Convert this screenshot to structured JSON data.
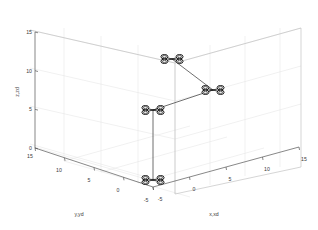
{
  "figure": {
    "kind": "matlab-3d-trajectory-plot",
    "background_color": "#ffffff",
    "axis_color": "#555555",
    "grid_color": "#e2e2e2",
    "trajectory_color": "#4a4a4a",
    "marker_color": "#1a1a1a"
  },
  "chart_data": {
    "type": "scatter",
    "title": "",
    "projection": "3d",
    "xlabel": "x,xd",
    "ylabel": "y,yd",
    "zlabel": "z,zd",
    "xlim": [
      -5,
      15
    ],
    "ylim": [
      -5,
      15
    ],
    "zlim": [
      0,
      15
    ],
    "xticks": [
      -5,
      0,
      5,
      10,
      15
    ],
    "yticks": [
      -5,
      0,
      5,
      10,
      15
    ],
    "zticks": [
      0,
      5,
      10,
      15
    ],
    "xticklabels": [
      "-5",
      "0",
      "5",
      "10",
      "15"
    ],
    "yticklabels": [
      "-5",
      "0",
      "5",
      "10",
      "15"
    ],
    "zticklabels": [
      "0",
      "5",
      "10",
      "15"
    ],
    "grid": true,
    "legend": false,
    "marker_style": "quadcopter-icon",
    "series": [
      {
        "name": "waypoint-trajectory",
        "points": [
          {
            "label": "wp1",
            "x": 0,
            "y": 0,
            "z": 0
          },
          {
            "label": "wp2",
            "x": 0,
            "y": 0,
            "z": 8
          },
          {
            "label": "wp3",
            "x": 5,
            "y": 0,
            "z": 10
          },
          {
            "label": "wp4",
            "x": 5,
            "y": 0,
            "z": 13
          }
        ]
      }
    ],
    "pixel_markers": [
      {
        "name": "drone-marker-1",
        "cx": 172.0,
        "cy": 59.0
      },
      {
        "name": "drone-marker-2",
        "cx": 213.0,
        "cy": 90.0
      },
      {
        "name": "drone-marker-3",
        "cx": 153.0,
        "cy": 110.0
      },
      {
        "name": "drone-marker-4",
        "cx": 153.0,
        "cy": 180.0
      }
    ],
    "pixel_path": "M 172,59 L 213,90 L 153,110 L 153,180"
  },
  "axes": {
    "z": {
      "title": "z,zd",
      "ticks": [
        {
          "label": "15",
          "x": 27.0,
          "y": 33.0
        },
        {
          "label": "10",
          "x": 27.0,
          "y": 70.0
        },
        {
          "label": "5",
          "x": 29.0,
          "y": 108.0
        },
        {
          "label": "0",
          "x": 29.0,
          "y": 146.0
        }
      ],
      "title_pos": {
        "x": 19.0,
        "y": 92.0
      }
    },
    "y": {
      "title": "y,yd",
      "ticks": [
        {
          "label": "15",
          "x": 27.0,
          "y": 155.0
        },
        {
          "label": "10",
          "x": 52.0,
          "y": 171.0
        },
        {
          "label": "5",
          "x": 81.0,
          "y": 183.0
        },
        {
          "label": "0",
          "x": 110.0,
          "y": 194.0
        },
        {
          "label": "-5",
          "x": 137.0,
          "y": 204.0
        }
      ],
      "title_pos": {
        "x": 79.0,
        "y": 214.0
      }
    },
    "x": {
      "title": "x,xd",
      "ticks": [
        {
          "label": "-5",
          "x": 155.0,
          "y": 205.0
        },
        {
          "label": "0",
          "x": 186.0,
          "y": 196.0
        },
        {
          "label": "5",
          "x": 221.0,
          "y": 186.0
        },
        {
          "label": "10",
          "x": 255.0,
          "y": 176.0
        },
        {
          "label": "15",
          "x": 290.0,
          "y": 166.0
        }
      ],
      "title_pos": {
        "x": 212.0,
        "y": 214.0
      }
    }
  }
}
